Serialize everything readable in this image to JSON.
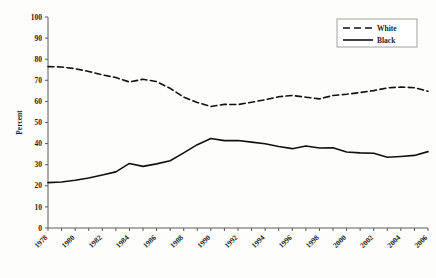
{
  "chart_data": {
    "type": "line",
    "title": "",
    "xlabel": "",
    "ylabel": "Percent",
    "ylim": [
      0,
      100
    ],
    "xlim": [
      1978,
      2006
    ],
    "ytick_step": 10,
    "yticks": [
      0,
      10,
      20,
      30,
      40,
      50,
      60,
      70,
      80,
      90,
      100
    ],
    "xticks": [
      1978,
      1980,
      1982,
      1984,
      1986,
      1988,
      1990,
      1992,
      1994,
      1996,
      1998,
      2000,
      2002,
      2004,
      2006
    ],
    "x_tick_label_rotation": -45,
    "x": [
      1978,
      1979,
      1980,
      1981,
      1982,
      1983,
      1984,
      1985,
      1986,
      1987,
      1988,
      1989,
      1990,
      1991,
      1992,
      1993,
      1994,
      1995,
      1996,
      1997,
      1998,
      1999,
      2000,
      2001,
      2002,
      2003,
      2004,
      2005,
      2006
    ],
    "grid": false,
    "legend_position": "top-right",
    "series": [
      {
        "name": "White",
        "style": "dashed",
        "color": "#111111",
        "values": [
          76.5,
          76.3,
          75.5,
          74.2,
          72.6,
          71.3,
          69.2,
          70.5,
          69.4,
          66.2,
          62.0,
          59.5,
          57.6,
          58.6,
          58.5,
          59.6,
          60.8,
          62.2,
          62.8,
          62.0,
          61.2,
          62.8,
          63.4,
          64.2,
          65.1,
          66.4,
          66.8,
          66.5,
          64.8
        ]
      },
      {
        "name": "Black",
        "style": "solid",
        "color": "#111111",
        "values": [
          21.5,
          21.8,
          22.6,
          23.7,
          25.1,
          26.6,
          30.6,
          29.2,
          30.4,
          31.9,
          35.6,
          39.5,
          42.4,
          41.4,
          41.5,
          40.7,
          39.9,
          38.6,
          37.6,
          38.9,
          37.9,
          38.0,
          36.0,
          35.6,
          35.4,
          33.5,
          33.9,
          34.4,
          36.2
        ]
      }
    ]
  },
  "legend": {
    "entries": [
      {
        "label": "White",
        "style": "dashed"
      },
      {
        "label": "Black",
        "style": "solid"
      }
    ]
  },
  "axes": {
    "y_title": "Percent"
  }
}
